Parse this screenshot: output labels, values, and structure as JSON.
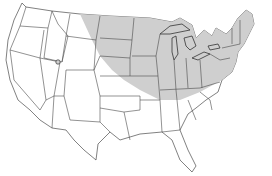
{
  "map": {
    "subject": "United States map with shaded range region",
    "region_label": "",
    "colors": {
      "background": "#ffffff",
      "land": "#ffffff",
      "range_shading": "#cfcfcf",
      "borders": "#4a4a4a"
    },
    "shaded_region": "Northern Great Plains, Midwest, Great Lakes, Ohio Valley, Northeast and New England",
    "marker": "small shaded spot in northern Utah"
  }
}
